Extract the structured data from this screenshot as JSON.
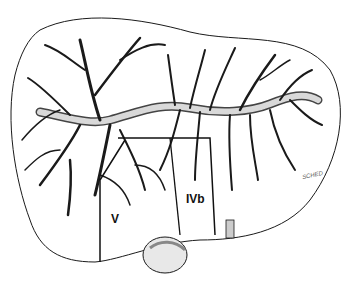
{
  "figure": {
    "labels": [
      {
        "id": "segment-v",
        "text": "V",
        "x": 111,
        "y": 218
      },
      {
        "id": "segment-ivb",
        "text": "IVb",
        "x": 188,
        "y": 198
      }
    ],
    "signature": "SCHED",
    "colors": {
      "ink": "#1a1a1a",
      "vessel_fill": "#d9d9d9",
      "background": "#ffffff",
      "gallbladder": "#bdbdbd"
    }
  }
}
